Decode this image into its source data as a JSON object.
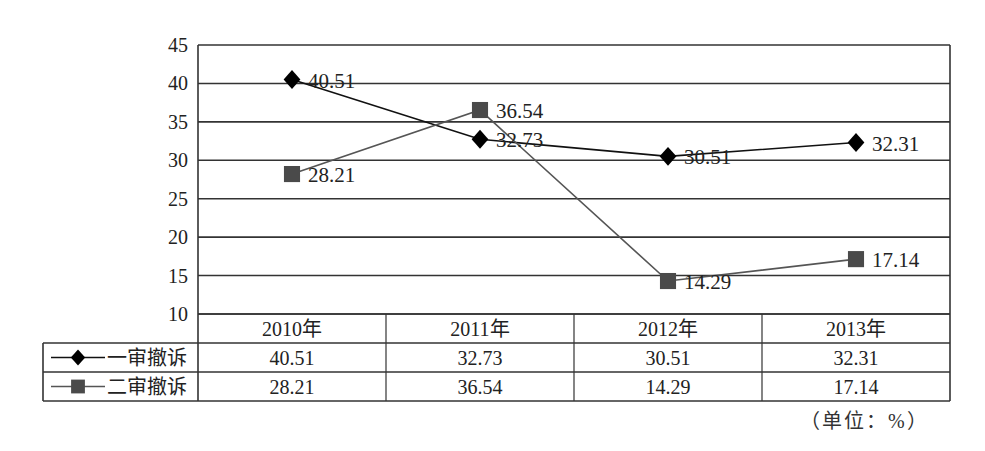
{
  "chart_data": {
    "type": "line",
    "title": "",
    "xlabel": "",
    "ylabel": "",
    "categories": [
      "2010年",
      "2011年",
      "2012年",
      "2013年"
    ],
    "series": [
      {
        "name": "一审撤诉",
        "marker": "diamond",
        "color": "#111111",
        "values": [
          40.51,
          32.73,
          30.51,
          32.31
        ]
      },
      {
        "name": "二审撤诉",
        "marker": "square",
        "color": "#555555",
        "values": [
          28.21,
          36.54,
          14.29,
          17.14
        ]
      }
    ],
    "ylim": [
      10,
      45
    ],
    "yticks": [
      10,
      15,
      20,
      25,
      30,
      35,
      40,
      45
    ],
    "grid": true,
    "data_labels": true,
    "legend_position": "data-table-left",
    "data_table": {
      "headers": [
        "2010年",
        "2011年",
        "2012年",
        "2013年"
      ],
      "rows": [
        {
          "label": "一审撤诉",
          "values": [
            "40.51",
            "32.73",
            "30.51",
            "32.31"
          ]
        },
        {
          "label": "二审撤诉",
          "values": [
            "28.21",
            "36.54",
            "14.29",
            "17.14"
          ]
        }
      ]
    },
    "unit_note": "（单位：%）"
  }
}
